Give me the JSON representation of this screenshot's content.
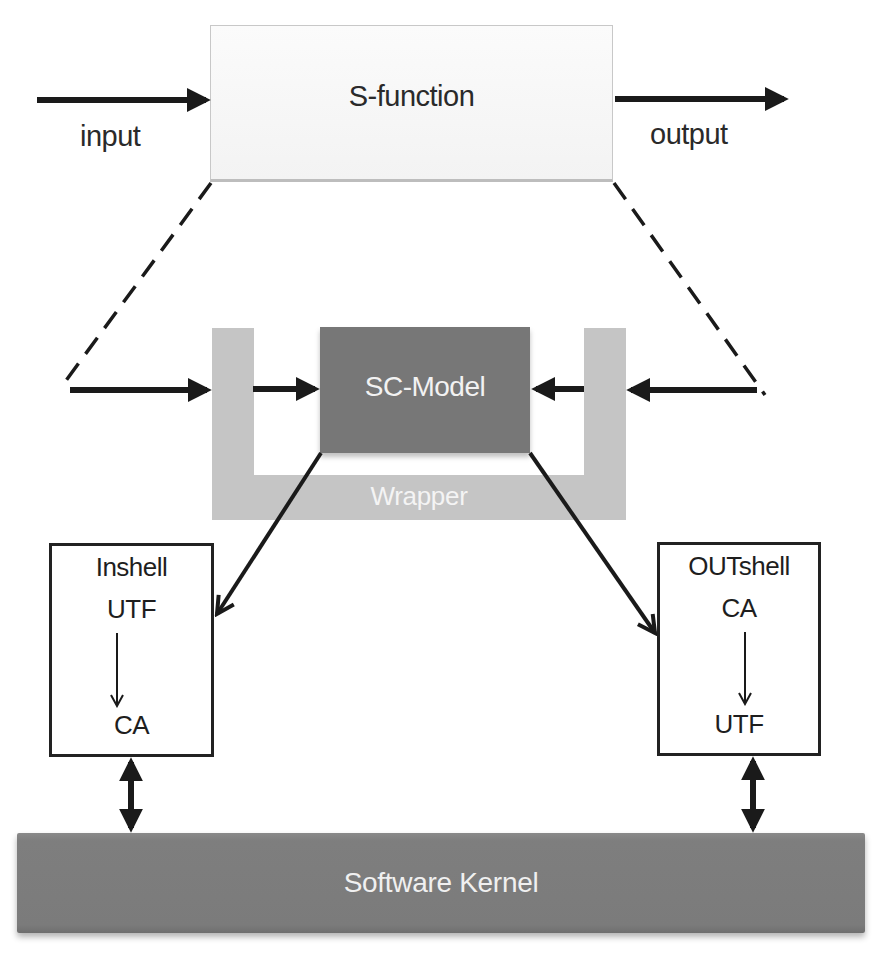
{
  "diagram": {
    "sfunction": {
      "label": "S-function",
      "fill": "#f7f7f7"
    },
    "input_label": "input",
    "output_label": "output",
    "wrapper": {
      "label": "Wrapper",
      "fill": "#c5c5c5"
    },
    "sc_model": {
      "label": "SC-Model",
      "fill": "#777777"
    },
    "inshell": {
      "title": "Inshell",
      "from": "UTF",
      "to": "CA"
    },
    "outshell": {
      "title": "OUTshell",
      "from": "CA",
      "to": "UTF"
    },
    "kernel": {
      "label": "Software Kernel",
      "fill": "#7e7e7e"
    },
    "connections": [
      {
        "from": "input",
        "to": "S-function",
        "type": "arrow"
      },
      {
        "from": "S-function",
        "to": "output",
        "type": "arrow"
      },
      {
        "from": "S-function",
        "to": "Wrapper",
        "type": "dashed-zoom"
      },
      {
        "from": "input",
        "to": "Wrapper",
        "type": "arrow"
      },
      {
        "from": "Wrapper",
        "to": "SC-Model",
        "type": "arrow"
      },
      {
        "from": "output",
        "to": "Wrapper",
        "type": "arrow"
      },
      {
        "from": "Wrapper",
        "to": "SC-Model",
        "type": "arrow"
      },
      {
        "from": "SC-Model",
        "to": "Inshell",
        "type": "arrow"
      },
      {
        "from": "SC-Model",
        "to": "OUTshell",
        "type": "arrow"
      },
      {
        "from": "Inshell",
        "to": "Software Kernel",
        "type": "bidirectional"
      },
      {
        "from": "OUTshell",
        "to": "Software Kernel",
        "type": "bidirectional"
      }
    ]
  }
}
